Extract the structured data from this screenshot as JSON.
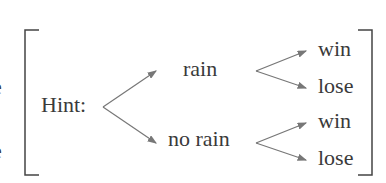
{
  "left_edge_fragments": [
    "r",
    "-",
    "e",
    "-",
    "e"
  ],
  "diagram": {
    "hint_label": "Hint:",
    "level1": [
      "rain",
      "no rain"
    ],
    "level2": {
      "rain": [
        "win",
        "lose"
      ],
      "no_rain": [
        "win",
        "lose"
      ]
    }
  },
  "colors": {
    "text": "#3a3a3a",
    "lines": "#777777",
    "bracket": "#444444"
  }
}
